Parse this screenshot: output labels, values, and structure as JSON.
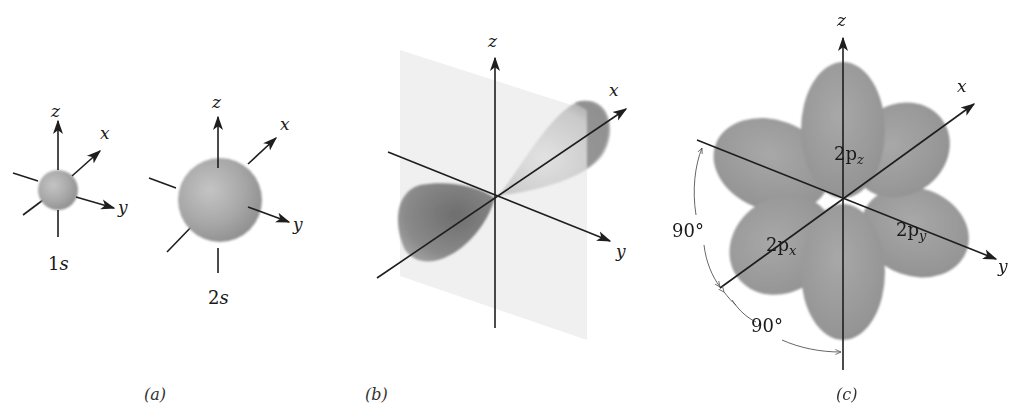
{
  "figure": {
    "panels": [
      {
        "id": "a",
        "caption": "(a)",
        "description": "Spherical s orbitals",
        "orbitals": [
          {
            "label_main": "1",
            "label_sub": "s",
            "axes": {
              "z": "z",
              "x": "x",
              "y": "y"
            }
          },
          {
            "label_main": "2",
            "label_sub": "s",
            "axes": {
              "z": "z",
              "x": "x",
              "y": "y"
            }
          }
        ]
      },
      {
        "id": "b",
        "caption": "(b)",
        "description": "Single p orbital with nodal plane",
        "axes": {
          "z": "z",
          "x": "x",
          "y": "y"
        }
      },
      {
        "id": "c",
        "caption": "(c)",
        "description": "Three 2p orbitals at right angles",
        "axes": {
          "z": "z",
          "x": "x",
          "y": "y"
        },
        "orbital_labels": [
          {
            "main": "2p",
            "sub": "z"
          },
          {
            "main": "2p",
            "sub": "x"
          },
          {
            "main": "2p",
            "sub": "y"
          }
        ],
        "angles": [
          "90°",
          "90°"
        ]
      }
    ]
  },
  "colors": {
    "orbital_fill": "#9a9a9a",
    "orbital_dark": "#7a7a7a",
    "plane": "#ececec",
    "axis": "#1e1e1e"
  }
}
